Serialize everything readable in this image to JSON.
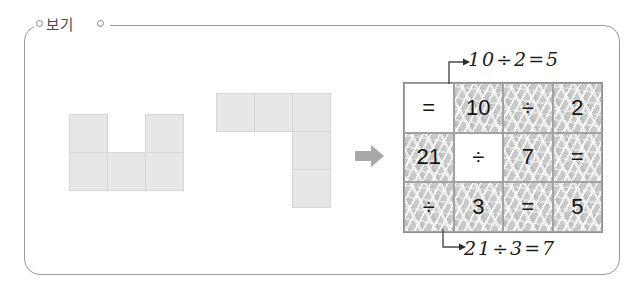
{
  "frame": {
    "label": "보기",
    "border_color": "#9a9a9a"
  },
  "shapes": {
    "colors": {
      "fill": "#e6e7e7",
      "stroke": "#d4d6d6"
    },
    "items": [
      {
        "name": "u-pentomino",
        "cell_size": 39,
        "cells": [
          [
            0,
            0
          ],
          [
            2,
            0
          ],
          [
            0,
            1
          ],
          [
            1,
            1
          ],
          [
            2,
            1
          ]
        ]
      },
      {
        "name": "l-pentomino",
        "cell_size": 39,
        "cells": [
          [
            0,
            0
          ],
          [
            1,
            0
          ],
          [
            2,
            0
          ],
          [
            2,
            1
          ],
          [
            2,
            2
          ]
        ]
      }
    ]
  },
  "flow": {
    "arrow_icon": "right-arrow-icon",
    "arrow_color": "#a8a8a8"
  },
  "puzzle": {
    "rows": 3,
    "cols": 4,
    "cells": [
      [
        {
          "text": "=",
          "shaded": false
        },
        {
          "text": "10",
          "shaded": true
        },
        {
          "text": "÷",
          "shaded": true
        },
        {
          "text": "2",
          "shaded": true
        }
      ],
      [
        {
          "text": "21",
          "shaded": true
        },
        {
          "text": "÷",
          "shaded": false
        },
        {
          "text": "7",
          "shaded": true
        },
        {
          "text": "=",
          "shaded": true
        }
      ],
      [
        {
          "text": "÷",
          "shaded": true
        },
        {
          "text": "3",
          "shaded": true
        },
        {
          "text": "=",
          "shaded": true
        },
        {
          "text": "5",
          "shaded": true
        }
      ]
    ],
    "border_color": "#8e8e8e",
    "shade_color": "#c9c9c9"
  },
  "annotations": {
    "top": "10÷2=5",
    "bottom": "21÷3=7"
  }
}
